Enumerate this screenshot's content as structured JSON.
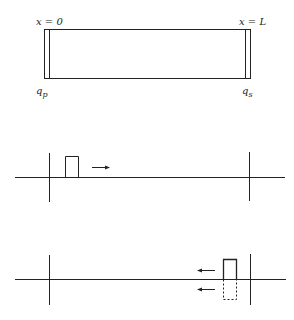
{
  "diagram": {
    "rod": {
      "left_label": "x = 0",
      "right_label": "x = L",
      "left_flux_label": {
        "base": "q",
        "sub": "p"
      },
      "right_flux_label": {
        "base": "q",
        "sub": "s"
      }
    },
    "panels": [
      {
        "name": "incident-pulse",
        "pulse_direction": "right",
        "pulse_style": "solid"
      },
      {
        "name": "reflected-pulse",
        "pulse_direction": "left",
        "pulse_style": "solid-above-dashed-below"
      }
    ],
    "colors": {
      "line": "#222222",
      "background": "#ffffff"
    }
  }
}
